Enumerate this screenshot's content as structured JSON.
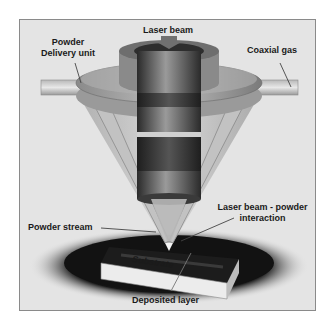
{
  "diagram": {
    "labels": {
      "laser_beam": "Laser beam",
      "powder_delivery_line1": "Powder",
      "powder_delivery_line2": "Delivery unit",
      "coaxial_gas": "Coaxial gas",
      "powder_stream": "Powder stream",
      "interaction_line1": "Laser beam - powder",
      "interaction_line2": "interaction",
      "substrate": "Substrate",
      "deposited_layer": "Deposited layer"
    },
    "colors": {
      "background": "#e4e4e4",
      "frame_border": "#8a8a8a",
      "shadow": "#111111",
      "nozzle_light": "#c8c8c8",
      "nozzle_dark": "#555555",
      "beam_dark": "#2e2e2e",
      "substrate_face": "#ececec",
      "label_text": "#1a1a1a"
    }
  }
}
